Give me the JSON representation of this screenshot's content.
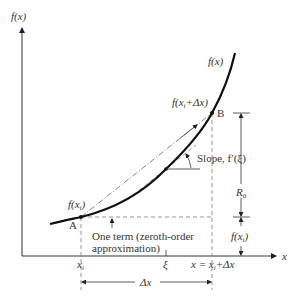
{
  "figure": {
    "y_axis_label": "f(x)",
    "x_axis_label": "x",
    "curve_label": "f(x)",
    "point_a_label": "A",
    "point_b_label": "B",
    "f_xi_label_main": "f(x",
    "f_xi_label_sub": "i",
    "f_xi_label_close": ")",
    "f_xi_dx_main": "f(x",
    "f_xi_dx_sub": "i",
    "f_xi_dx_close": "+Δx)",
    "slope_label": "Slope, f′(ξ)",
    "r0_label_main": "R",
    "r0_label_sub": "0",
    "right_fxi_main": "f(x",
    "right_fxi_sub": "i",
    "right_fxi_close": ")",
    "zeroth_order_line1": "One term (zeroth-order",
    "zeroth_order_line2": "approximation)",
    "tick_xi_main": "x",
    "tick_xi_sub": "i",
    "tick_xi_label": "ξ",
    "tick_x_main": "x = x",
    "tick_x_sub": "i",
    "tick_x_close": "+Δx",
    "delta_x_label": "Δx"
  },
  "colors": {
    "ink": "#222222",
    "dashed": "#888888",
    "text": "#333333"
  }
}
